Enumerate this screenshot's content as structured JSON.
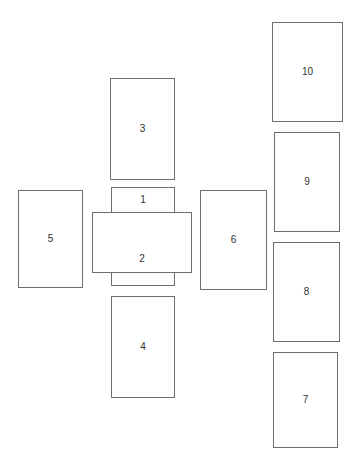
{
  "diagram": {
    "background_color": "#ffffff",
    "stroke_color": "#6e6e6e",
    "label_color": "#303030",
    "canvas": {
      "width": 361,
      "height": 468
    },
    "shapes": [
      {
        "id": "rect-1",
        "label": "1",
        "x": 111,
        "y": 187,
        "w": 64,
        "h": 26,
        "label_position": "center",
        "note": "narrow horizontal bar above the large central rectangle"
      },
      {
        "id": "rect-2",
        "label": "2",
        "x": 92,
        "y": 212,
        "w": 100,
        "h": 61,
        "label_position": "lower",
        "note": "large central rectangle, widest of the central stack"
      },
      {
        "id": "rect-unlabeled-bottom",
        "label": "",
        "x": 111,
        "y": 272,
        "w": 64,
        "h": 14,
        "label_position": "center",
        "note": "small unlabeled bar directly below the central rectangle"
      },
      {
        "id": "rect-3",
        "label": "3",
        "x": 110,
        "y": 78,
        "w": 65,
        "h": 102,
        "label_position": "center",
        "note": "upper rectangle in the central column"
      },
      {
        "id": "rect-4",
        "label": "4",
        "x": 111,
        "y": 296,
        "w": 64,
        "h": 102,
        "label_position": "center",
        "note": "lower rectangle in the central column"
      },
      {
        "id": "rect-5",
        "label": "5",
        "x": 18,
        "y": 190,
        "w": 65,
        "h": 98,
        "label_position": "center",
        "note": "left-hand rectangle"
      },
      {
        "id": "rect-6",
        "label": "6",
        "x": 200,
        "y": 190,
        "w": 67,
        "h": 100,
        "label_position": "center",
        "note": "rectangle to the right of the central stack"
      },
      {
        "id": "rect-7",
        "label": "7",
        "x": 273,
        "y": 352,
        "w": 65,
        "h": 96,
        "label_position": "center",
        "note": "bottom rectangle of the right-hand column"
      },
      {
        "id": "rect-8",
        "label": "8",
        "x": 273,
        "y": 242,
        "w": 67,
        "h": 100,
        "label_position": "center",
        "note": "third rectangle of the right-hand column"
      },
      {
        "id": "rect-9",
        "label": "9",
        "x": 274,
        "y": 132,
        "w": 66,
        "h": 100,
        "label_position": "center",
        "note": "second rectangle of the right-hand column"
      },
      {
        "id": "rect-10",
        "label": "10",
        "x": 272,
        "y": 22,
        "w": 71,
        "h": 100,
        "label_position": "center",
        "note": "top rectangle of the right-hand column"
      }
    ]
  }
}
